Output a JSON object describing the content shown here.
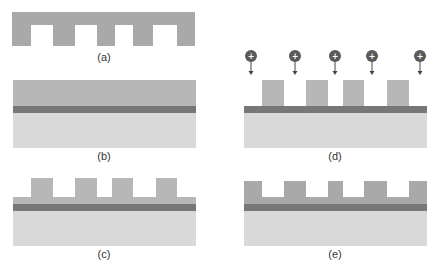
{
  "colors": {
    "stamp": "#a9a9a9",
    "resist": "#b7b7b7",
    "transfer_layer": "#777777",
    "substrate": "#d9d9d9",
    "ion": "#5a5a5a",
    "background": "#ffffff"
  },
  "panels": [
    {
      "id": "a",
      "label": "(a)",
      "description": "Mold / stamp with recessed features"
    },
    {
      "id": "b",
      "label": "(b)",
      "description": "Resist layer on transfer layer and substrate"
    },
    {
      "id": "c",
      "label": "(c)",
      "description": "Imprinted resist with residual layer"
    },
    {
      "id": "d",
      "label": "(d)",
      "description": "Ion etching of resist pattern"
    },
    {
      "id": "e",
      "label": "(e)",
      "description": "Pattern after etching"
    }
  ],
  "ions": {
    "count": 5,
    "symbol": "+"
  }
}
